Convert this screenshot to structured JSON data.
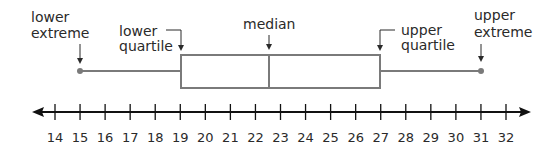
{
  "chart_data": {
    "type": "boxplot",
    "title": "",
    "xlabel": "",
    "axis": {
      "min": 14,
      "max": 32,
      "ticks": [
        14,
        15,
        16,
        17,
        18,
        19,
        20,
        21,
        22,
        23,
        24,
        25,
        26,
        27,
        28,
        29,
        30,
        31,
        32
      ]
    },
    "values": {
      "lower_extreme": 15,
      "lower_quartile": 19,
      "median": 22.5,
      "upper_quartile": 27,
      "upper_extreme": 31
    },
    "annotations": {
      "lower_extreme": [
        "lower",
        "extreme"
      ],
      "lower_quartile": [
        "lower",
        "quartile"
      ],
      "median": [
        "median"
      ],
      "upper_quartile": [
        "upper",
        "quartile"
      ],
      "upper_extreme": [
        "upper",
        "extreme"
      ]
    }
  },
  "colors": {
    "box": "#7a7a7a",
    "axis": "#111111",
    "text": "#2a2a2a"
  }
}
